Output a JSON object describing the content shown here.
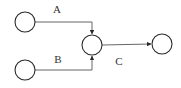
{
  "diagram": {
    "type": "flow-graph",
    "nodes": [
      {
        "id": "n1",
        "cx": 25,
        "cy": 22,
        "r": 10
      },
      {
        "id": "n2",
        "cx": 25,
        "cy": 70,
        "r": 10
      },
      {
        "id": "n3",
        "cx": 92,
        "cy": 45,
        "r": 10
      },
      {
        "id": "n4",
        "cx": 162,
        "cy": 44,
        "r": 10
      }
    ],
    "edges": [
      {
        "id": "A",
        "label": "A",
        "from": "n1",
        "to": "n3",
        "path": "M35,22 L92,22 L92,34",
        "label_x": 57,
        "label_y": 13
      },
      {
        "id": "B",
        "label": "B",
        "from": "n2",
        "to": "n3",
        "path": "M35,70 L92,70 L92,56",
        "label_x": 58,
        "label_y": 63
      },
      {
        "id": "C",
        "label": "C",
        "from": "n3",
        "to": "n4",
        "path": "M102,45 L151,44",
        "label_x": 119,
        "label_y": 65
      }
    ],
    "colors": {
      "node_stroke": "#2a2a2a",
      "edge_stroke": "#555555",
      "label": "#333333",
      "background": "#ffffff"
    }
  }
}
